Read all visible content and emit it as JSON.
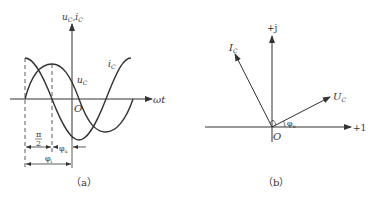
{
  "figure_a": {
    "caption": "（a）",
    "y_axis_label_u": "u",
    "y_axis_label_u_sub": "C",
    "y_axis_sep": ",",
    "y_axis_label_i": "i",
    "y_axis_label_i_sub": "C",
    "x_axis_label": "ωt",
    "origin_label": "O",
    "curve_i_label": "i",
    "curve_i_sub": "C",
    "curve_u_label": "u",
    "curve_u_sub": "C",
    "dim_pi_num": "π",
    "dim_pi_den": "2",
    "dim_phi_u": "φ",
    "dim_phi_u_sub": "u",
    "dim_phi_i": "φ",
    "dim_phi_i_sub": "i"
  },
  "figure_b": {
    "caption": "（b）",
    "imag_axis_label": "+j",
    "real_axis_label": "+1",
    "origin_label": "O",
    "phasor_i_label": "I",
    "phasor_i_sub": "C",
    "phasor_u_label": "U",
    "phasor_u_sub": "C",
    "angle_label": "φ",
    "angle_sub": "u"
  },
  "colors": {
    "stroke": "#333333",
    "background": "#ffffff"
  }
}
